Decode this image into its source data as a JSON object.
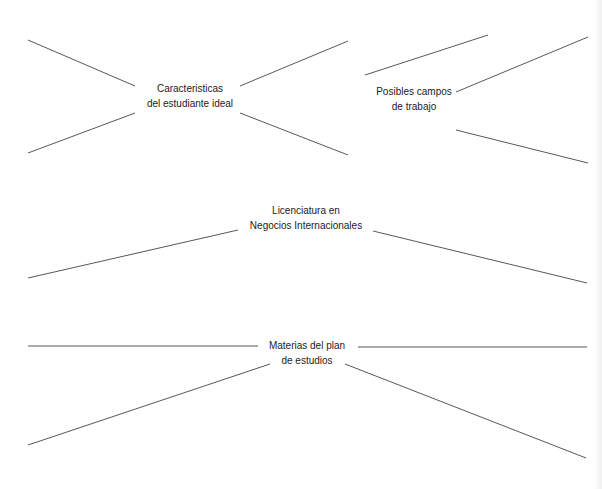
{
  "diagram": {
    "type": "mind-map worksheet",
    "nodes": {
      "caracteristicas": {
        "line1": "Caracteristicas",
        "line2": "del estudiante ideal"
      },
      "campos": {
        "line1": "Posibles campos",
        "line2": "de trabajo"
      },
      "licenciatura": {
        "line1": "Licenciatura en",
        "line2": "Negocios Internacionales"
      },
      "materias": {
        "line1": "Materias del plan",
        "line2": "de estudios"
      }
    },
    "line_color": "#444444",
    "background": "#ffffff"
  }
}
